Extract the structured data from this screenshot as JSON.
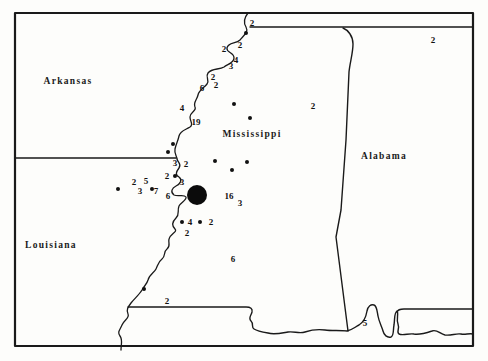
{
  "figure": {
    "kind": "state distribution map",
    "ink_color": "#1a1a1a",
    "paper_color": "#fdfdfb"
  },
  "map": {
    "state_labels": [
      {
        "id": "arkansas",
        "name": "Arkansas",
        "x": 68,
        "y": 81
      },
      {
        "id": "mississippi",
        "name": "Mississippi",
        "x": 252,
        "y": 134
      },
      {
        "id": "alabama",
        "name": "Alabama",
        "x": 384,
        "y": 156
      },
      {
        "id": "louisiana",
        "name": "Louisiana",
        "x": 51,
        "y": 245
      }
    ],
    "count_labels": [
      {
        "v": "2",
        "x": 252,
        "y": 23
      },
      {
        "v": "2",
        "x": 224,
        "y": 49
      },
      {
        "v": "2",
        "x": 240,
        "y": 45
      },
      {
        "v": "4",
        "x": 236,
        "y": 60
      },
      {
        "v": "3",
        "x": 231,
        "y": 66
      },
      {
        "v": "2",
        "x": 213,
        "y": 77
      },
      {
        "v": "2",
        "x": 216,
        "y": 85
      },
      {
        "v": "6",
        "x": 202,
        "y": 88
      },
      {
        "v": "4",
        "x": 182,
        "y": 108
      },
      {
        "v": "19",
        "x": 196,
        "y": 122
      },
      {
        "v": "2",
        "x": 313,
        "y": 106
      },
      {
        "v": "2",
        "x": 433,
        "y": 40
      },
      {
        "v": "3",
        "x": 175,
        "y": 163
      },
      {
        "v": "2",
        "x": 186,
        "y": 164
      },
      {
        "v": "2",
        "x": 167,
        "y": 176
      },
      {
        "v": "3",
        "x": 182,
        "y": 182
      },
      {
        "v": "2",
        "x": 134,
        "y": 182
      },
      {
        "v": "5",
        "x": 146,
        "y": 181
      },
      {
        "v": "3",
        "x": 140,
        "y": 191
      },
      {
        "v": "7",
        "x": 156,
        "y": 191
      },
      {
        "v": "6",
        "x": 168,
        "y": 196
      },
      {
        "v": "16",
        "x": 229,
        "y": 196
      },
      {
        "v": "3",
        "x": 240,
        "y": 203
      },
      {
        "v": "4",
        "x": 190,
        "y": 222
      },
      {
        "v": "2",
        "x": 211,
        "y": 222
      },
      {
        "v": "2",
        "x": 187,
        "y": 233
      },
      {
        "v": "6",
        "x": 233,
        "y": 259
      },
      {
        "v": "2",
        "x": 167,
        "y": 301
      },
      {
        "v": "5",
        "x": 365,
        "y": 323
      }
    ],
    "locality_dots": [
      {
        "x": 246,
        "y": 33
      },
      {
        "x": 234,
        "y": 104
      },
      {
        "x": 250,
        "y": 118
      },
      {
        "x": 173,
        "y": 144
      },
      {
        "x": 168,
        "y": 152
      },
      {
        "x": 215,
        "y": 161
      },
      {
        "x": 247,
        "y": 162
      },
      {
        "x": 232,
        "y": 170
      },
      {
        "x": 175,
        "y": 176
      },
      {
        "x": 152,
        "y": 189
      },
      {
        "x": 118,
        "y": 189
      },
      {
        "x": 182,
        "y": 222
      },
      {
        "x": 200,
        "y": 222
      },
      {
        "x": 144,
        "y": 289
      }
    ],
    "large_marker": {
      "x": 197,
      "y": 195,
      "r": 10
    }
  }
}
